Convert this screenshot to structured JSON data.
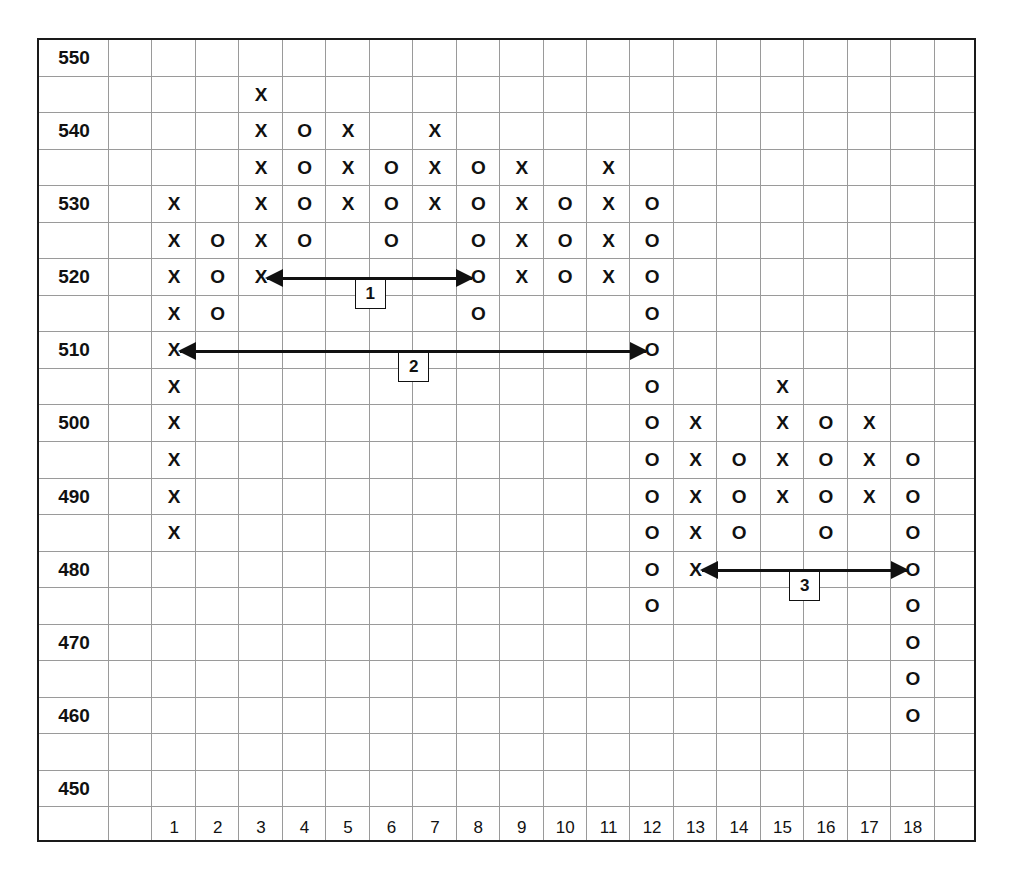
{
  "chart_data": {
    "type": "point-and-figure",
    "title": "",
    "box_size": 5,
    "ylim": [
      450,
      550
    ],
    "y_tick_labels": [
      "550",
      "540",
      "530",
      "520",
      "510",
      "500",
      "490",
      "480",
      "470",
      "460",
      "450"
    ],
    "x_tick_labels": [
      "1",
      "2",
      "3",
      "4",
      "5",
      "6",
      "7",
      "8",
      "9",
      "10",
      "11",
      "12",
      "13",
      "14",
      "15",
      "16",
      "17",
      "18"
    ],
    "grid": true,
    "columns": [
      {
        "index": 1,
        "symbol": "X",
        "low": 485,
        "high": 530
      },
      {
        "index": 2,
        "symbol": "O",
        "low": 515,
        "high": 525
      },
      {
        "index": 3,
        "symbol": "X",
        "low": 520,
        "high": 545
      },
      {
        "index": 4,
        "symbol": "O",
        "low": 525,
        "high": 540
      },
      {
        "index": 5,
        "symbol": "X",
        "low": 530,
        "high": 540
      },
      {
        "index": 6,
        "symbol": "O",
        "low": 525,
        "high": 535
      },
      {
        "index": 7,
        "symbol": "X",
        "low": 530,
        "high": 540
      },
      {
        "index": 8,
        "symbol": "O",
        "low": 515,
        "high": 535
      },
      {
        "index": 9,
        "symbol": "X",
        "low": 520,
        "high": 535
      },
      {
        "index": 10,
        "symbol": "O",
        "low": 520,
        "high": 530
      },
      {
        "index": 11,
        "symbol": "X",
        "low": 520,
        "high": 535
      },
      {
        "index": 12,
        "symbol": "O",
        "low": 475,
        "high": 530
      },
      {
        "index": 13,
        "symbol": "X",
        "low": 480,
        "high": 500
      },
      {
        "index": 14,
        "symbol": "O",
        "low": 485,
        "high": 495
      },
      {
        "index": 15,
        "symbol": "X",
        "low": 490,
        "high": 505
      },
      {
        "index": 16,
        "symbol": "O",
        "low": 485,
        "high": 500
      },
      {
        "index": 17,
        "symbol": "X",
        "low": 490,
        "high": 500
      },
      {
        "index": 18,
        "symbol": "O",
        "low": 460,
        "high": 495
      }
    ],
    "annotations": [
      {
        "label": "1",
        "type": "double-arrow",
        "price": 520,
        "from_column": 3,
        "to_column": 8
      },
      {
        "label": "2",
        "type": "double-arrow",
        "price": 510,
        "from_column": 1,
        "to_column": 12
      },
      {
        "label": "3",
        "type": "double-arrow",
        "price": 480,
        "from_column": 13,
        "to_column": 18
      }
    ]
  },
  "axis": {
    "y_labels": [
      "550",
      "540",
      "530",
      "520",
      "510",
      "500",
      "490",
      "480",
      "470",
      "460",
      "450"
    ],
    "x_labels": [
      "1",
      "2",
      "3",
      "4",
      "5",
      "6",
      "7",
      "8",
      "9",
      "10",
      "11",
      "12",
      "13",
      "14",
      "15",
      "16",
      "17",
      "18"
    ]
  },
  "annotations": {
    "a1": "1",
    "a2": "2",
    "a3": "3"
  }
}
